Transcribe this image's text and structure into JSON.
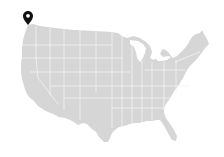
{
  "map": {
    "region": "United States (contiguous)",
    "land_color": "#d6d6d6",
    "border_color": "#f2f2f2",
    "background_color": "#ffffff"
  },
  "markers": [
    {
      "icon": "map-pin-icon",
      "color": "#111111",
      "location_hint": "Pacific Northwest (Washington)",
      "x": 28,
      "y": 25
    }
  ]
}
